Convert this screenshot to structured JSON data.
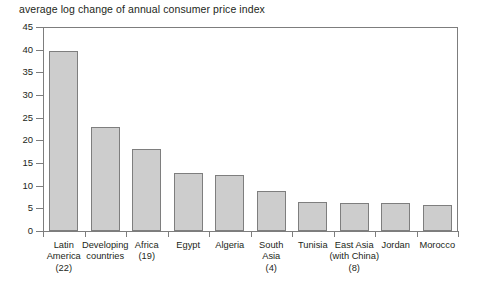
{
  "chart_data": {
    "type": "bar",
    "title": "average log change of annual consumer price index",
    "xlabel": "",
    "ylabel": "",
    "ylim": [
      0,
      45
    ],
    "ytick_step": 5,
    "yticks": [
      0,
      5,
      10,
      15,
      20,
      25,
      30,
      35,
      40,
      45
    ],
    "grid": false,
    "legend": null,
    "categories": [
      "Latin America (22)",
      "Developing countries",
      "Africa (19)",
      "Egypt",
      "Algeria",
      "South Asia (4)",
      "Tunisia",
      "East Asia (with China) (8)",
      "Jordan",
      "Morocco"
    ],
    "category_lines": [
      [
        "Latin",
        "America",
        "(22)"
      ],
      [
        "Developing",
        "countries"
      ],
      [
        "Africa",
        "(19)"
      ],
      [
        "Egypt"
      ],
      [
        "Algeria"
      ],
      [
        "South",
        "Asia",
        "(4)"
      ],
      [
        "Tunisia"
      ],
      [
        "East Asia",
        "(with China)",
        "(8)"
      ],
      [
        "Jordan"
      ],
      [
        "Morocco"
      ]
    ],
    "values": [
      39.6,
      23.0,
      18.0,
      12.7,
      12.4,
      8.9,
      6.4,
      6.2,
      6.1,
      5.7
    ]
  },
  "style": {
    "bar_fill": "#cdcdcd",
    "bar_border": "#7e7e7e",
    "axis_color": "#7d7d7d",
    "text_color": "#231f20",
    "background": "#ffffff"
  }
}
